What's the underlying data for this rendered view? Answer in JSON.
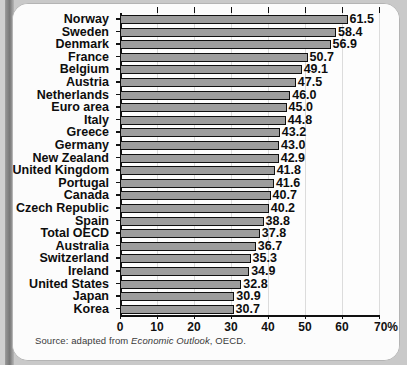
{
  "figure": {
    "source_prefix": "Source: adapted from ",
    "source_italic": "Economic Outlook",
    "source_suffix": ", OECD."
  },
  "chart_data": {
    "type": "bar",
    "orientation": "horizontal",
    "title": "",
    "xlabel": "",
    "ylabel": "",
    "xlim": [
      0,
      70
    ],
    "grid": true,
    "legend": false,
    "axis_suffix": "%",
    "tick_labels": [
      "0",
      "10",
      "20",
      "30",
      "40",
      "50",
      "60",
      "70%"
    ],
    "ticks": [
      0,
      10,
      20,
      30,
      40,
      50,
      60,
      70
    ],
    "categories": [
      "Norway",
      "Sweden",
      "Denmark",
      "France",
      "Belgium",
      "Austria",
      "Netherlands",
      "Euro area",
      "Italy",
      "Greece",
      "Germany",
      "New Zealand",
      "United Kingdom",
      "Portugal",
      "Canada",
      "Czech Republic",
      "Spain",
      "Total OECD",
      "Australia",
      "Switzerland",
      "Ireland",
      "United States",
      "Japan",
      "Korea"
    ],
    "values": [
      61.5,
      58.4,
      56.9,
      50.7,
      49.1,
      47.5,
      46.0,
      45.0,
      44.8,
      43.2,
      43.0,
      42.9,
      41.8,
      41.6,
      40.7,
      40.2,
      38.8,
      37.8,
      36.7,
      35.3,
      34.9,
      32.8,
      30.9,
      30.7
    ],
    "value_labels": [
      "61.5",
      "58.4",
      "56.9",
      "50.7",
      "49.1",
      "47.5",
      "46.0",
      "45.0",
      "44.8",
      "43.2",
      "43.0",
      "42.9",
      "41.8",
      "41.6",
      "40.7",
      "40.2",
      "38.8",
      "37.8",
      "36.7",
      "35.3",
      "34.9",
      "32.8",
      "30.9",
      "30.7"
    ],
    "colors": {
      "bar_fill": "#9d9d9d",
      "bar_edge": "#101010",
      "grid": "#dcdcdc",
      "axis": "#111111",
      "plot_background": "#fdfdfd",
      "card_background": "#fbfbfb",
      "page_background": "#c9c9c9"
    }
  }
}
